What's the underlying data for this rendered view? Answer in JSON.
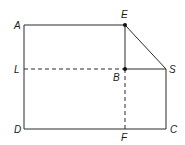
{
  "diagram": {
    "type": "geometry-figure",
    "points": {
      "A": {
        "label": "A",
        "x": 24,
        "y": 25
      },
      "E": {
        "label": "E",
        "x": 125,
        "y": 25
      },
      "L": {
        "label": "L",
        "x": 24,
        "y": 69
      },
      "B": {
        "label": "B",
        "x": 125,
        "y": 69
      },
      "S": {
        "label": "S",
        "x": 166,
        "y": 69
      },
      "D": {
        "label": "D",
        "x": 24,
        "y": 129
      },
      "F": {
        "label": "F",
        "x": 125,
        "y": 129
      },
      "C": {
        "label": "C",
        "x": 166,
        "y": 129
      }
    },
    "solid_segments": [
      "A-E",
      "E-B",
      "B-S",
      "E-S",
      "S-C",
      "C-D",
      "D-A"
    ],
    "dashed_segments": [
      "L-B",
      "B-F"
    ],
    "marked_points": [
      "E",
      "B"
    ],
    "colors": {
      "stroke": "#2a2a2a",
      "background": "#ffffff"
    }
  }
}
